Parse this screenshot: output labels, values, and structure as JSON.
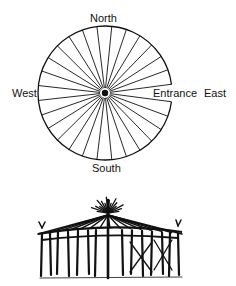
{
  "diagram": {
    "labels": {
      "north": "North",
      "south": "South",
      "west": "West",
      "east": "East",
      "entrance": "Entrance"
    },
    "plan": {
      "center": [
        105,
        93
      ],
      "radius": 67,
      "spoke_count": 28,
      "entrance_direction": "east",
      "center_post": "filled-dot"
    },
    "illustration": {
      "subject": "circular-lodge-with-center-pole-and-radiating-rafters"
    },
    "colors": {
      "ink": "#111111",
      "background": "#ffffff"
    }
  }
}
